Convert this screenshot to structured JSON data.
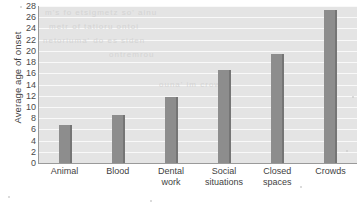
{
  "chart_data": {
    "type": "bar",
    "title": "",
    "xlabel": "",
    "ylabel": "Average age of onset",
    "categories": [
      "Animal",
      "Blood",
      "Dental work",
      "Social situations",
      "Closed spaces",
      "Crowds"
    ],
    "category_lines": [
      [
        "Animal"
      ],
      [
        "Blood"
      ],
      [
        "Dental",
        "work"
      ],
      [
        "Social",
        "situations"
      ],
      [
        "Closed",
        "spaces"
      ],
      [
        "Crowds"
      ]
    ],
    "values": [
      6.8,
      8.5,
      11.7,
      16.5,
      19.5,
      27.3
    ],
    "ylim": [
      0,
      28
    ],
    "ytick_step": 2,
    "yticks": [
      0,
      2,
      4,
      6,
      8,
      10,
      12,
      14,
      16,
      18,
      20,
      22,
      24,
      26,
      28
    ],
    "grid": true,
    "legend": "none",
    "series": [
      {
        "name": "Average age of onset",
        "values": [
          6.8,
          8.5,
          11.7,
          16.5,
          19.5,
          27.3
        ]
      }
    ]
  },
  "style": {
    "bar_color": "#8d8d8d",
    "bar_edge_color": "#757575",
    "plot_background": "#e4e4e4",
    "gridline_color": "#fbfbfb",
    "axis_color": "#9a9a9a",
    "text_color": "#3f3f3f"
  },
  "artifacts": {
    "ghost_text": [
      "m's fo etsigmetz  so' ainu",
      "metr of tatioru ontoi",
      "netoriuma' do es siden",
      "ontremrou",
      "ouna' im crown"
    ]
  }
}
